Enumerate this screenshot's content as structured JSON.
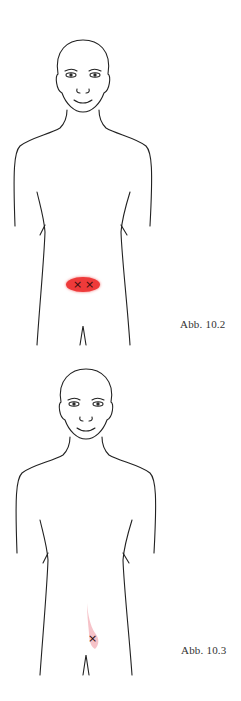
{
  "figures": [
    {
      "caption": "Abb. 10.2",
      "zone": {
        "shape": "ellipse",
        "color": "#ee3a3a",
        "markers": 2,
        "location": "lower abdomen, centered"
      }
    },
    {
      "caption": "Abb. 10.3",
      "zone": {
        "shape": "vertical-band",
        "color": "#f4b8bf",
        "markers": 1,
        "location": "lower abdomen, right of midline"
      }
    }
  ],
  "marker_symbol": "×",
  "line_color": "#222222"
}
